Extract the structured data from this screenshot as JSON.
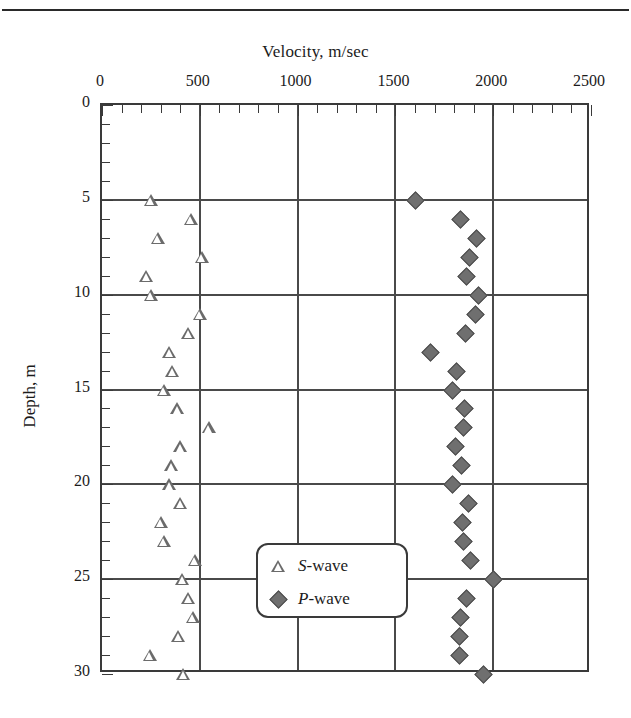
{
  "figure": {
    "x_axis_title": "Velocity, m/sec",
    "y_axis_title": "Depth, m"
  },
  "legend": {
    "items": [
      {
        "symbol": "open-triangle",
        "label_italic": "S",
        "label_rest": "-wave"
      },
      {
        "symbol": "filled-diamond",
        "label_italic": "P",
        "label_rest": "-wave"
      }
    ]
  },
  "chart_data": {
    "type": "scatter",
    "title": "",
    "xlabel": "Velocity, m/sec",
    "ylabel": "Depth, m",
    "xlim": [
      0,
      2500
    ],
    "ylim": [
      0,
      30
    ],
    "y_inverted": true,
    "grid": true,
    "legend_position": "inside-lower-center",
    "xticks": [
      0,
      500,
      1000,
      1500,
      2000,
      2500
    ],
    "xtick_labels": [
      "0",
      "500",
      "1000",
      "1500",
      "2000",
      "2500"
    ],
    "x_minor_tick_interval": 100,
    "yticks": [
      0,
      5,
      10,
      15,
      20,
      25,
      30
    ],
    "ytick_labels": [
      "0",
      "5",
      "10",
      "15",
      "20",
      "25",
      "30"
    ],
    "y_minor_tick_interval": 1,
    "series": [
      {
        "name": "S-wave",
        "marker": "open-triangle",
        "color": "#6b6b6b",
        "x_label": "velocity",
        "y_label": "depth",
        "points": [
          {
            "velocity": 250,
            "depth": 5
          },
          {
            "velocity": 455,
            "depth": 6
          },
          {
            "velocity": 285,
            "depth": 7
          },
          {
            "velocity": 510,
            "depth": 8
          },
          {
            "velocity": 225,
            "depth": 9
          },
          {
            "velocity": 250,
            "depth": 10
          },
          {
            "velocity": 500,
            "depth": 11
          },
          {
            "velocity": 440,
            "depth": 12
          },
          {
            "velocity": 345,
            "depth": 13
          },
          {
            "velocity": 360,
            "depth": 14
          },
          {
            "velocity": 315,
            "depth": 15
          },
          {
            "velocity": 385,
            "depth": 16
          },
          {
            "velocity": 545,
            "depth": 17
          },
          {
            "velocity": 400,
            "depth": 18
          },
          {
            "velocity": 355,
            "depth": 19
          },
          {
            "velocity": 345,
            "depth": 20
          },
          {
            "velocity": 400,
            "depth": 21
          },
          {
            "velocity": 300,
            "depth": 22
          },
          {
            "velocity": 315,
            "depth": 23
          },
          {
            "velocity": 475,
            "depth": 24
          },
          {
            "velocity": 410,
            "depth": 25
          },
          {
            "velocity": 440,
            "depth": 26
          },
          {
            "velocity": 465,
            "depth": 27
          },
          {
            "velocity": 390,
            "depth": 28
          },
          {
            "velocity": 245,
            "depth": 29
          },
          {
            "velocity": 415,
            "depth": 30
          }
        ]
      },
      {
        "name": "P-wave",
        "marker": "filled-diamond",
        "color": "#6f6f6f",
        "x_label": "velocity",
        "y_label": "depth",
        "points": [
          {
            "velocity": 1600,
            "depth": 5
          },
          {
            "velocity": 1830,
            "depth": 6
          },
          {
            "velocity": 1910,
            "depth": 7
          },
          {
            "velocity": 1875,
            "depth": 8
          },
          {
            "velocity": 1860,
            "depth": 9
          },
          {
            "velocity": 1920,
            "depth": 10
          },
          {
            "velocity": 1905,
            "depth": 11
          },
          {
            "velocity": 1855,
            "depth": 12
          },
          {
            "velocity": 1675,
            "depth": 13
          },
          {
            "velocity": 1810,
            "depth": 14
          },
          {
            "velocity": 1790,
            "depth": 15
          },
          {
            "velocity": 1850,
            "depth": 16
          },
          {
            "velocity": 1845,
            "depth": 17
          },
          {
            "velocity": 1805,
            "depth": 18
          },
          {
            "velocity": 1835,
            "depth": 19
          },
          {
            "velocity": 1790,
            "depth": 20
          },
          {
            "velocity": 1870,
            "depth": 21
          },
          {
            "velocity": 1840,
            "depth": 22
          },
          {
            "velocity": 1845,
            "depth": 23
          },
          {
            "velocity": 1880,
            "depth": 24
          },
          {
            "velocity": 2000,
            "depth": 25
          },
          {
            "velocity": 1860,
            "depth": 26
          },
          {
            "velocity": 1830,
            "depth": 27
          },
          {
            "velocity": 1825,
            "depth": 28
          },
          {
            "velocity": 1825,
            "depth": 29
          },
          {
            "velocity": 1950,
            "depth": 30
          }
        ]
      }
    ]
  }
}
